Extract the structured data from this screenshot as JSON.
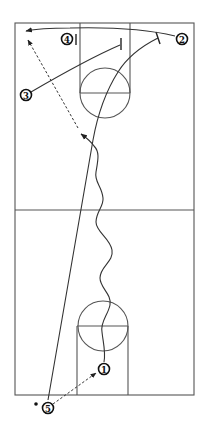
{
  "diagram": {
    "type": "basketball-play-diagram",
    "court": {
      "outline": {
        "x": 15,
        "y": 23,
        "width": 180,
        "height": 372
      },
      "midcourt_y": 210,
      "top_key": {
        "lane_x1": 80,
        "lane_x2": 130,
        "baseline_y": 23,
        "free_throw_y": 93,
        "circle_cx": 105,
        "circle_cy": 93,
        "circle_r": 25
      },
      "bottom_key": {
        "lane_x1": 77,
        "lane_x2": 128,
        "baseline_y": 395,
        "free_throw_y": 326,
        "circle_cx": 103,
        "circle_cy": 326,
        "circle_r": 25
      }
    },
    "players": [
      {
        "label": "1",
        "x": 104,
        "y": 369
      },
      {
        "label": "2",
        "x": 182,
        "y": 39
      },
      {
        "label": "3",
        "x": 26,
        "y": 95
      },
      {
        "label": "4",
        "x": 67,
        "y": 39
      },
      {
        "label": "5",
        "x": 48,
        "y": 408
      }
    ],
    "ball_marker": {
      "x": 36,
      "y": 404
    },
    "actions": [
      {
        "kind": "inbound-pass",
        "from": "5",
        "to": "1",
        "style": "dashed"
      },
      {
        "kind": "dribble",
        "player": "1",
        "style": "wavy"
      },
      {
        "kind": "pass",
        "to": "corner",
        "style": "dashed"
      },
      {
        "kind": "cut",
        "player": "5",
        "style": "solid",
        "end": "screen"
      },
      {
        "kind": "cut",
        "player": "2",
        "style": "solid",
        "end": "arrow"
      },
      {
        "kind": "cut",
        "player": "3",
        "style": "solid",
        "end": "screen"
      },
      {
        "kind": "screen",
        "player": "4"
      }
    ]
  }
}
